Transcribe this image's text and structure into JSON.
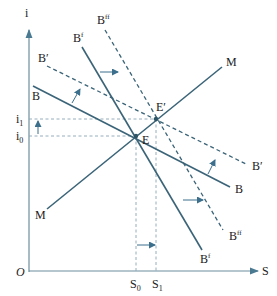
{
  "diagram": {
    "axes": {
      "y_label": "i",
      "x_label": "S",
      "origin_label": "O",
      "y_ticks": [
        {
          "label": "i",
          "sub": "1"
        },
        {
          "label": "i",
          "sub": "0"
        }
      ],
      "x_ticks": [
        {
          "label": "S",
          "sub": "0"
        },
        {
          "label": "S",
          "sub": "1"
        }
      ]
    },
    "curves": {
      "M": {
        "label": "M",
        "style": "solid"
      },
      "B": {
        "label": "B",
        "style": "solid"
      },
      "B_prime": {
        "label": "B′",
        "style": "dashed"
      },
      "B_f": {
        "label": "B",
        "sup": "f",
        "style": "solid"
      },
      "B_ff": {
        "label": "B",
        "sup": "ff",
        "style": "dashed"
      }
    },
    "points": {
      "E": "E",
      "E_prime": "E′"
    },
    "colors": {
      "line": "#3b6478",
      "axis": "#6d8e9d",
      "guide": "#8aa5b3"
    }
  }
}
